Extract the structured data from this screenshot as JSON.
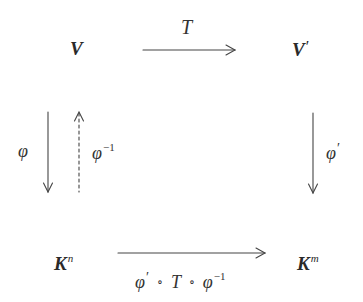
{
  "diagram": {
    "type": "commutative-diagram",
    "nodes": {
      "top_left": {
        "base": "V",
        "sup": ""
      },
      "top_right": {
        "base": "V",
        "prime": "′"
      },
      "bottom_left": {
        "base": "K",
        "sup": "n"
      },
      "bottom_right": {
        "base": "K",
        "sup": "m"
      }
    },
    "edges": {
      "top": {
        "label": "T",
        "from": "V",
        "to": "V′",
        "style": "solid"
      },
      "left_down": {
        "label_base": "φ",
        "from": "V",
        "to": "Kⁿ",
        "style": "solid"
      },
      "left_up": {
        "label_base": "φ",
        "label_sup": "−1",
        "from": "Kⁿ",
        "to": "V",
        "style": "dashed"
      },
      "right_down": {
        "label_base": "φ",
        "label_prime": "′",
        "from": "V′",
        "to": "Kᵐ",
        "style": "solid"
      },
      "bottom": {
        "label_parts": {
          "p1": "φ",
          "p1_prime": "′",
          "op1": "∘",
          "p2": "T",
          "op2": "∘",
          "p3": "φ",
          "p3_sup": "−1"
        },
        "from": "Kⁿ",
        "to": "Kᵐ",
        "style": "solid"
      }
    },
    "colors": {
      "ink": "#2a2a2a",
      "arrow": "#444444",
      "background": "#ffffff"
    }
  }
}
